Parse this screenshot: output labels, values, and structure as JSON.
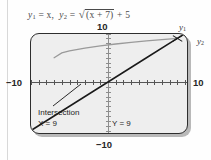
{
  "figure": {
    "title_parts": {
      "y1_var": "y",
      "y1_sub": "1",
      "y1_eq": " = x,",
      "y2_var": "y",
      "y2_sub": "2",
      "y2_eq": " = ",
      "radical_sign": "√",
      "radicand": "(x + 7)",
      "tail": " + 5"
    },
    "title_text": "y1 = x,  y2 = √(x + 7) + 5"
  },
  "axis_labels": {
    "top": "10",
    "bottom": "−10",
    "left": "−10",
    "right": "10"
  },
  "curve_tags": {
    "y1": {
      "var": "y",
      "sub": "1"
    },
    "y2": {
      "var": "y",
      "sub": "2"
    }
  },
  "readout": {
    "intersection_label": "Intersection",
    "x_value": "X = 9",
    "y_value": "Y = 9"
  },
  "colors": {
    "screen_fill": "#eeeeee",
    "screen_border": "#2e2e2e",
    "line_y1": "#1a1a1a",
    "curve_y2": "#9a9a9a",
    "axis": "#555555"
  },
  "chart_data": {
    "type": "line",
    "xlabel": "x",
    "ylabel": "y",
    "xlim": [
      -10,
      10
    ],
    "ylim": [
      -10,
      10
    ],
    "grid": false,
    "legend": [
      "y1",
      "y2"
    ],
    "legend_position": "right-of-curve-ends",
    "tick_spacing": 1,
    "series": [
      {
        "name": "y1",
        "equation": "y = x",
        "x": [
          -10,
          -5,
          0,
          5,
          9,
          10
        ],
        "y": [
          -10,
          -5,
          0,
          5,
          9,
          10
        ]
      },
      {
        "name": "y2",
        "equation": "y = sqrt(x + 7) + 5",
        "x": [
          -7,
          -6,
          -5,
          -3,
          -1,
          1,
          3,
          5,
          7,
          9
        ],
        "y": [
          5,
          6,
          6.41,
          7,
          7.45,
          7.83,
          8.16,
          8.46,
          8.74,
          9
        ]
      }
    ],
    "annotations": [
      {
        "label": "Intersection",
        "x": 9,
        "y": 9
      },
      {
        "label": "X = 9",
        "x": 9,
        "y": 9
      },
      {
        "label": "Y = 9",
        "x": 9,
        "y": 9
      }
    ]
  }
}
